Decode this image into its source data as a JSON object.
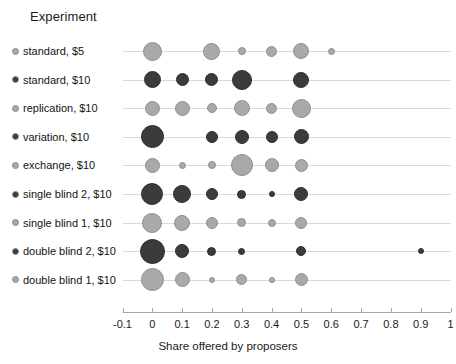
{
  "legend": {
    "title": "Experiment",
    "items": [
      {
        "label": "standard, $5",
        "color": "#a9a9a9"
      },
      {
        "label": "standard, $10",
        "color": "#3b3b3b"
      },
      {
        "label": "replication, $10",
        "color": "#a9a9a9"
      },
      {
        "label": "variation, $10",
        "color": "#3b3b3b"
      },
      {
        "label": "exchange, $10",
        "color": "#a9a9a9"
      },
      {
        "label": "single blind 2, $10",
        "color": "#3b3b3b"
      },
      {
        "label": "single blind 1, $10",
        "color": "#a9a9a9"
      },
      {
        "label": "double blind 2, $10",
        "color": "#3b3b3b"
      },
      {
        "label": "double blind 1, $10",
        "color": "#a9a9a9"
      }
    ]
  },
  "axis": {
    "title": "Share offered by proposers",
    "ticks": [
      "-0.1",
      "0",
      "0.1",
      "0.2",
      "0.3",
      "0.4",
      "0.5",
      "0.6",
      "0.7",
      "0.8",
      "0.9",
      "1"
    ],
    "min": -0.1,
    "max": 1.0
  },
  "chart_data": {
    "type": "scatter",
    "title": "",
    "xlabel": "Share offered by proposers",
    "ylabel": "Experiment",
    "xlim": [
      -0.1,
      1.0
    ],
    "grid": true,
    "legend_position": "left",
    "note": "Bubble (balloon) plot: marker area encodes relative frequency of each offered share within an experiment row.",
    "categories": [
      "standard, $5",
      "standard, $10",
      "replication, $10",
      "variation, $10",
      "exchange, $10",
      "single blind 2, $10",
      "single blind 1, $10",
      "double blind 2, $10",
      "double blind 1, $10"
    ],
    "series": [
      {
        "name": "standard, $5",
        "color": "#a9a9a9",
        "points": [
          {
            "x": 0.0,
            "size": 19
          },
          {
            "x": 0.2,
            "size": 17
          },
          {
            "x": 0.3,
            "size": 8
          },
          {
            "x": 0.4,
            "size": 11
          },
          {
            "x": 0.5,
            "size": 16
          },
          {
            "x": 0.6,
            "size": 7
          }
        ]
      },
      {
        "name": "standard, $10",
        "color": "#3b3b3b",
        "points": [
          {
            "x": 0.0,
            "size": 17
          },
          {
            "x": 0.1,
            "size": 13
          },
          {
            "x": 0.2,
            "size": 13
          },
          {
            "x": 0.3,
            "size": 20
          },
          {
            "x": 0.5,
            "size": 16
          }
        ]
      },
      {
        "name": "replication, $10",
        "color": "#a9a9a9",
        "points": [
          {
            "x": 0.0,
            "size": 15
          },
          {
            "x": 0.1,
            "size": 15
          },
          {
            "x": 0.2,
            "size": 10
          },
          {
            "x": 0.3,
            "size": 16
          },
          {
            "x": 0.4,
            "size": 11
          },
          {
            "x": 0.5,
            "size": 19
          }
        ]
      },
      {
        "name": "variation, $10",
        "color": "#3b3b3b",
        "points": [
          {
            "x": 0.0,
            "size": 23
          },
          {
            "x": 0.2,
            "size": 12
          },
          {
            "x": 0.3,
            "size": 14
          },
          {
            "x": 0.4,
            "size": 12
          },
          {
            "x": 0.5,
            "size": 15
          }
        ]
      },
      {
        "name": "exchange, $10",
        "color": "#a9a9a9",
        "points": [
          {
            "x": 0.0,
            "size": 15
          },
          {
            "x": 0.1,
            "size": 7
          },
          {
            "x": 0.2,
            "size": 8
          },
          {
            "x": 0.3,
            "size": 22
          },
          {
            "x": 0.4,
            "size": 14
          },
          {
            "x": 0.5,
            "size": 13
          }
        ]
      },
      {
        "name": "single blind 2, $10",
        "color": "#3b3b3b",
        "points": [
          {
            "x": 0.0,
            "size": 22
          },
          {
            "x": 0.1,
            "size": 18
          },
          {
            "x": 0.2,
            "size": 12
          },
          {
            "x": 0.3,
            "size": 9
          },
          {
            "x": 0.4,
            "size": 6
          },
          {
            "x": 0.5,
            "size": 14
          }
        ]
      },
      {
        "name": "single blind 1, $10",
        "color": "#a9a9a9",
        "points": [
          {
            "x": 0.0,
            "size": 20
          },
          {
            "x": 0.1,
            "size": 16
          },
          {
            "x": 0.2,
            "size": 12
          },
          {
            "x": 0.3,
            "size": 9
          },
          {
            "x": 0.4,
            "size": 8
          },
          {
            "x": 0.5,
            "size": 12
          }
        ]
      },
      {
        "name": "double blind 2, $10",
        "color": "#3b3b3b",
        "points": [
          {
            "x": 0.0,
            "size": 25
          },
          {
            "x": 0.1,
            "size": 14
          },
          {
            "x": 0.2,
            "size": 9
          },
          {
            "x": 0.3,
            "size": 7
          },
          {
            "x": 0.5,
            "size": 10
          },
          {
            "x": 0.9,
            "size": 6
          }
        ]
      },
      {
        "name": "double blind 1, $10",
        "color": "#a9a9a9",
        "points": [
          {
            "x": 0.0,
            "size": 23
          },
          {
            "x": 0.1,
            "size": 15
          },
          {
            "x": 0.2,
            "size": 6
          },
          {
            "x": 0.3,
            "size": 11
          },
          {
            "x": 0.4,
            "size": 6
          },
          {
            "x": 0.5,
            "size": 13
          }
        ]
      }
    ]
  }
}
